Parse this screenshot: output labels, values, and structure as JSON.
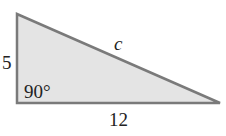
{
  "diagram": {
    "type": "right-triangle",
    "colors": {
      "fill": "#e4e4e4",
      "stroke": "#7a7a7a",
      "text": "#222222"
    },
    "vertices": {
      "top_left": [
        17,
        14
      ],
      "bottom_left": [
        17,
        103
      ],
      "right": [
        220,
        103
      ]
    },
    "labels": {
      "vertical_side": "5",
      "horizontal_side": "12",
      "hypotenuse": "c",
      "right_angle": "90°"
    }
  }
}
